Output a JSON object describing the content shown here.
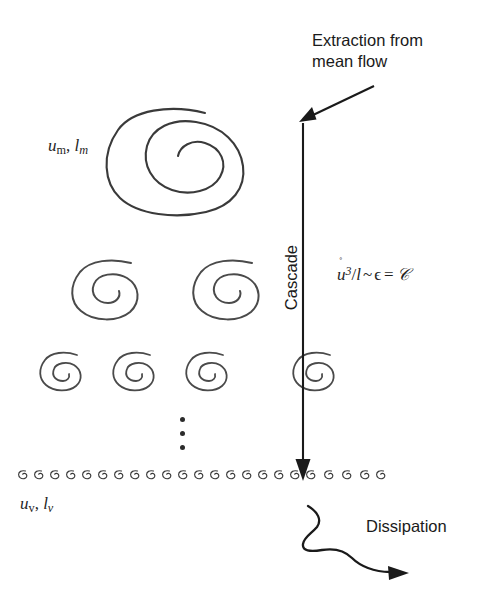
{
  "figure": {
    "title_absent": true,
    "background_color": "#ffffff",
    "ink_color": "#2b2b2b"
  },
  "annotations": {
    "extraction": "Extraction from\nmean flow",
    "cascade": "Cascade",
    "dissipation": "Dissipation"
  },
  "scale_labels": {
    "large_eddy": {
      "velocity": "u",
      "velocity_sub": "m",
      "length": "l",
      "length_sub": "m",
      "separator": ", "
    },
    "small_eddy": {
      "velocity": "u",
      "velocity_sub": "v",
      "length": "l",
      "length_sub": "v",
      "separator": ", "
    }
  },
  "formula": {
    "u_symbol": "u",
    "u_accent": "˚",
    "u_exponent": "3",
    "divider": "/",
    "length_symbol": "l",
    "similar": "~",
    "epsilon": "ϵ",
    "equals": "=",
    "constant": "𝒞",
    "plain_text": "ŭ³/l ~ ϵ = 𝒞"
  },
  "diagram_elements": {
    "large_eddy_count": 1,
    "medium_eddy_count": 2,
    "small_eddy_count": 4,
    "ellipsis_dots": 3,
    "dissipation_scale_eddy_count": 24,
    "cascade_arrow_direction": "down",
    "extraction_arrow_direction": "down-left",
    "dissipation_arrow_direction": "down-right-wavy"
  }
}
